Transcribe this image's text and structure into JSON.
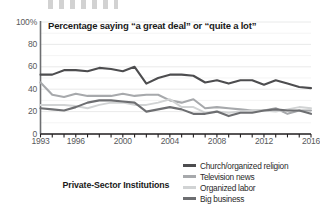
{
  "chart_data": {
    "type": "line",
    "title": "Percentage saying “a great deal” or “quite a lot”",
    "caption": "Private-Sector Institutions",
    "xlabel": "",
    "ylabel": "",
    "ylim": [
      0,
      100
    ],
    "xlim": [
      1993,
      2016
    ],
    "grid": true,
    "legend_position": "bottom-right",
    "ytick_labels": [
      "100%",
      "80",
      "60",
      "40",
      "20",
      "0"
    ],
    "ytick_values": [
      100,
      80,
      60,
      40,
      20,
      0
    ],
    "xtick_labels": [
      "1993",
      "1996",
      "2000",
      "2004",
      "2008",
      "2012",
      "2016"
    ],
    "xtick_values": [
      1993,
      1996,
      2000,
      2004,
      2008,
      2012,
      2016
    ],
    "x": [
      1993,
      1994,
      1995,
      1996,
      1997,
      1998,
      1999,
      2000,
      2001,
      2002,
      2003,
      2004,
      2005,
      2006,
      2007,
      2008,
      2009,
      2010,
      2011,
      2012,
      2013,
      2014,
      2015,
      2016
    ],
    "series": [
      {
        "name": "Church/organized religion",
        "color": "#4d4d4f",
        "values": [
          53,
          53,
          57,
          57,
          56,
          59,
          58,
          56,
          60,
          45,
          50,
          53,
          53,
          52,
          46,
          48,
          45,
          48,
          48,
          44,
          48,
          45,
          42,
          41
        ]
      },
      {
        "name": "Television news",
        "color": "#a7a9ac",
        "values": [
          46,
          35,
          33,
          36,
          34,
          34,
          34,
          36,
          34,
          35,
          35,
          30,
          28,
          31,
          23,
          24,
          23,
          22,
          21,
          21,
          23,
          18,
          21,
          21
        ]
      },
      {
        "name": "Organized labor",
        "color": "#d1d3d4",
        "values": [
          26,
          26,
          26,
          25,
          23,
          26,
          28,
          28,
          26,
          26,
          28,
          31,
          24,
          24,
          19,
          20,
          19,
          20,
          21,
          21,
          20,
          22,
          24,
          23
        ]
      },
      {
        "name": "Big business",
        "color": "#6d6e71",
        "values": [
          23,
          22,
          21,
          24,
          28,
          30,
          30,
          29,
          28,
          20,
          22,
          24,
          22,
          18,
          18,
          20,
          16,
          19,
          19,
          21,
          22,
          21,
          21,
          18
        ]
      }
    ]
  }
}
